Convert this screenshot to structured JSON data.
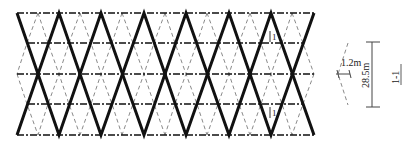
{
  "diagram": {
    "type": "diagrid structure elevation",
    "labels": {
      "section_marker_top": "1",
      "section_marker_bottom": "1",
      "module_width": "1.2m",
      "height": "28.5m",
      "section_title": "1-1"
    },
    "colors": {
      "main_member": "#111111",
      "secondary_member": "#8a8a8a",
      "floor_line": "#111111",
      "dimension": "#444444"
    },
    "geometry": {
      "left_x": 17,
      "right_x": 314,
      "top_y": 13,
      "bottom_y": 135,
      "floor_lines_y": [
        13,
        43,
        74,
        104,
        135
      ],
      "main_top_vertices_x": [
        17,
        59,
        101,
        144,
        186,
        229,
        271,
        314
      ]
    }
  }
}
